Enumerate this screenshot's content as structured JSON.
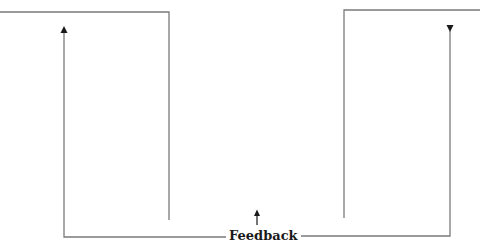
{
  "diagram": {
    "feedback_label": "Feedback",
    "colors": {
      "line": "#7a7a7a",
      "arrow": "#1a1a1a",
      "text": "#1a1a1a",
      "background": "#ffffff"
    },
    "elements": [
      {
        "id": "left-frame",
        "type": "polyline",
        "points": [
          [
            0,
            12
          ],
          [
            169,
            12
          ],
          [
            169,
            220
          ]
        ]
      },
      {
        "id": "left-feedback-path",
        "type": "polyline",
        "points": [
          [
            228,
            237
          ],
          [
            64,
            237
          ],
          [
            64,
            30
          ]
        ],
        "arrow": "up"
      },
      {
        "id": "right-frame",
        "type": "polyline",
        "points": [
          [
            480,
            10
          ],
          [
            344,
            10
          ],
          [
            344,
            218
          ]
        ]
      },
      {
        "id": "right-feedback-path",
        "type": "polyline",
        "points": [
          [
            290,
            236
          ],
          [
            450,
            236
          ],
          [
            450,
            30
          ]
        ],
        "arrow": "down-at-top"
      },
      {
        "id": "center-arrow",
        "type": "arrow",
        "from": [
          257,
          225
        ],
        "to": [
          257,
          211
        ],
        "direction": "up"
      }
    ]
  }
}
